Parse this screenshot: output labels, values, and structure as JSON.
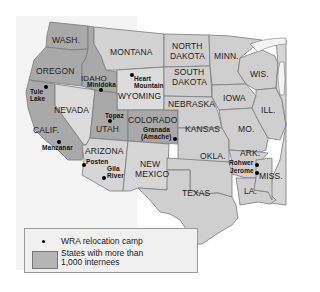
{
  "map": {
    "title": "",
    "colors": {
      "highlighted_state": "#a9a9a9",
      "other_state": "#cfcfcf",
      "light_state": "#dcdcdc",
      "border": "#7a7a7a",
      "background": "#f4f4f4",
      "camp_dot": "#000000"
    },
    "states": [
      {
        "label": "WASH.",
        "highlighted": true
      },
      {
        "label": "OREGON",
        "highlighted": true
      },
      {
        "label": "CALIF.",
        "highlighted": true
      },
      {
        "label": "IDAHO",
        "highlighted": true
      },
      {
        "label": "NEVADA",
        "highlighted": false
      },
      {
        "label": "MONTANA",
        "highlighted": false
      },
      {
        "label": "WYOMING",
        "highlighted": false
      },
      {
        "label": "UTAH",
        "highlighted": true
      },
      {
        "label": "ARIZONA",
        "highlighted": false
      },
      {
        "label": "COLORADO",
        "highlighted": true
      },
      {
        "label": "NEW MEXICO",
        "line1": "NEW",
        "line2": "MEXICO",
        "highlighted": false
      },
      {
        "label": "NORTH DAKOTA",
        "line1": "NORTH",
        "line2": "DAKOTA",
        "highlighted": false
      },
      {
        "label": "SOUTH DAKOTA",
        "line1": "SOUTH",
        "line2": "DAKOTA",
        "highlighted": false
      },
      {
        "label": "NEBRASKA",
        "highlighted": false
      },
      {
        "label": "KANSAS",
        "highlighted": false
      },
      {
        "label": "OKLA.",
        "highlighted": false
      },
      {
        "label": "TEXAS",
        "highlighted": false
      },
      {
        "label": "MINN.",
        "highlighted": false
      },
      {
        "label": "IOWA",
        "highlighted": false
      },
      {
        "label": "MO.",
        "highlighted": false
      },
      {
        "label": "WIS.",
        "highlighted": false
      },
      {
        "label": "ILL.",
        "highlighted": false
      },
      {
        "label": "ARK.",
        "highlighted": false
      },
      {
        "label": "LA.",
        "highlighted": false
      },
      {
        "label": "MISS.",
        "highlighted": false
      }
    ],
    "camps": [
      {
        "name": "Tule Lake",
        "line1": "Tule",
        "line2": "Lake"
      },
      {
        "name": "Minidoka"
      },
      {
        "name": "Heart Mountain",
        "line1": "Heart",
        "line2": "Mountain"
      },
      {
        "name": "Manzanar"
      },
      {
        "name": "Topaz"
      },
      {
        "name": "Granada (Amache)",
        "line1": "Granada",
        "line2": "(Amache)"
      },
      {
        "name": "Posten"
      },
      {
        "name": "Gila River",
        "line1": "Gila",
        "line2": "River"
      },
      {
        "name": "Rohwer"
      },
      {
        "name": "Jerome"
      }
    ]
  },
  "legend": {
    "camp_label": "WRA relocation camp",
    "states_label_line1": "States with more than",
    "states_label_line2": "1,000 internees"
  }
}
